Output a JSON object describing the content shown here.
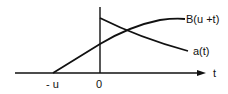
{
  "diagram": {
    "labels": {
      "b_curve": "B(u +t)",
      "a_curve": "a(t)",
      "x_axis": "t",
      "tick_neg_u": "- u",
      "tick_zero": "0"
    },
    "colors": {
      "line": "#111111",
      "background": "#ffffff"
    }
  }
}
